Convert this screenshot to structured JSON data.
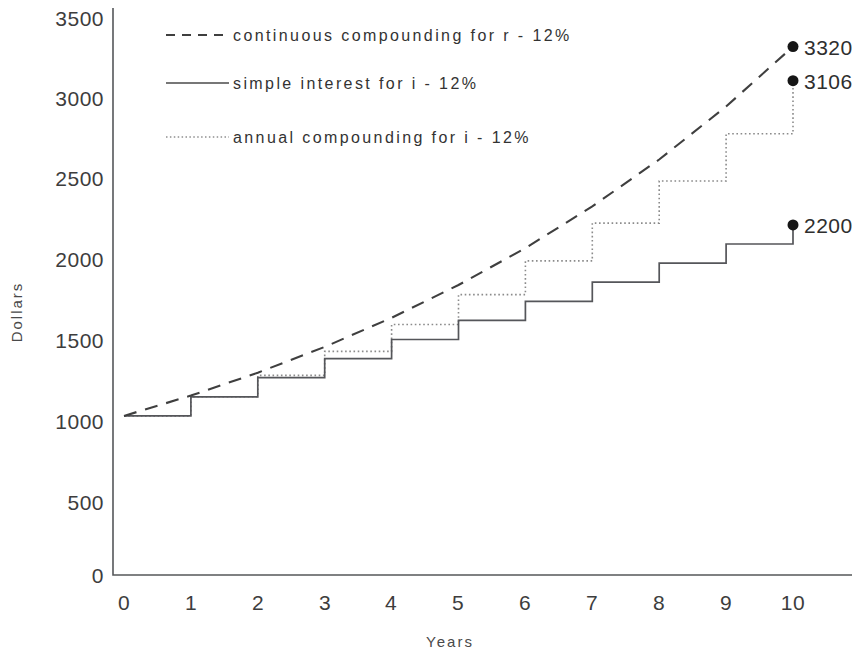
{
  "chart_data": {
    "type": "line",
    "title": "",
    "subtitle": "",
    "xlabel": "Years",
    "ylabel": "Dollars",
    "x": [
      0,
      1,
      2,
      3,
      4,
      5,
      6,
      7,
      8,
      9,
      10
    ],
    "xlim": [
      0,
      10
    ],
    "ylim": [
      0,
      3500
    ],
    "xticks": [
      "0",
      "1",
      "2",
      "3",
      "4",
      "5",
      "6",
      "7",
      "8",
      "9",
      "10"
    ],
    "yticks": [
      "0",
      "500",
      "1000",
      "1500",
      "2000",
      "2500",
      "3000",
      "3500"
    ],
    "ytick_values": [
      0,
      500,
      1000,
      1500,
      2000,
      2500,
      3000,
      3500
    ],
    "grid": false,
    "legend_position": "upper-left",
    "principal": 1000,
    "rate_percent": 12,
    "series": [
      {
        "name": "continuous compounding for r - 12%",
        "style": "dashed",
        "shape": "smooth",
        "values": [
          1000,
          1127,
          1271,
          1433,
          1616,
          1822,
          2054,
          2316,
          2611,
          2944,
          3320
        ],
        "end_label": "3320"
      },
      {
        "name": "annual compounding for i - 12%",
        "style": "dotted",
        "shape": "step",
        "values": [
          1000,
          1120,
          1254,
          1405,
          1574,
          1762,
          1974,
          2211,
          2476,
          2773,
          3106
        ],
        "end_label": "3106"
      },
      {
        "name": "simple interest for i - 12%",
        "style": "solid",
        "shape": "step",
        "values": [
          1000,
          1120,
          1240,
          1360,
          1480,
          1600,
          1720,
          1840,
          1960,
          2080,
          2200
        ],
        "end_label": "2200"
      }
    ],
    "annotations": [
      {
        "text": "3320",
        "series": "continuous compounding for r - 12%",
        "x": 10,
        "y": 3320
      },
      {
        "text": "3106",
        "series": "annual compounding for i - 12%",
        "x": 10,
        "y": 3106
      },
      {
        "text": "2200",
        "series": "simple interest for i - 12%",
        "x": 10,
        "y": 2200
      }
    ]
  },
  "legend": {
    "items": [
      {
        "label": "continuous compounding for r - 12%",
        "style": "dashed"
      },
      {
        "label": "simple interest for i - 12%",
        "style": "solid"
      },
      {
        "label": "annual compounding for i - 12%",
        "style": "dotted"
      }
    ]
  },
  "axes": {
    "x_title": "Years",
    "y_title": "Dollars",
    "x_ticks": [
      "0",
      "1",
      "2",
      "3",
      "4",
      "5",
      "6",
      "7",
      "8",
      "9",
      "10"
    ],
    "y_ticks": [
      "3500",
      "3000",
      "2500",
      "2000",
      "1500",
      "1000",
      "500",
      "0"
    ]
  },
  "colors": {
    "background": "#ffffff",
    "axis": "#55585a",
    "continuous": "#3f3f3f",
    "simple": "#55565a",
    "annual": "#8b8b8b",
    "text": "#3a3a3a",
    "marker": "#161616"
  }
}
